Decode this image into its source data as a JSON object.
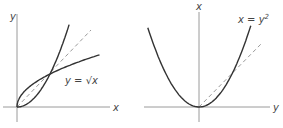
{
  "panels": [
    {
      "id": "left",
      "x_axis_label": "x",
      "y_axis_label": "y",
      "curve_label": "y = √x",
      "curves": [
        "y = x^2",
        "y = sqrt(x)"
      ],
      "reference_line": "y = x (dashed)",
      "intersection": [
        1,
        1
      ]
    },
    {
      "id": "right",
      "horizontal_axis_label": "y",
      "vertical_axis_label": "x",
      "curve_label_base": "x = y",
      "curve_label_exp": "2",
      "curves": [
        "x = y^2"
      ],
      "reference_line": "x = y (dashed)",
      "intersection": [
        1,
        1
      ]
    }
  ]
}
